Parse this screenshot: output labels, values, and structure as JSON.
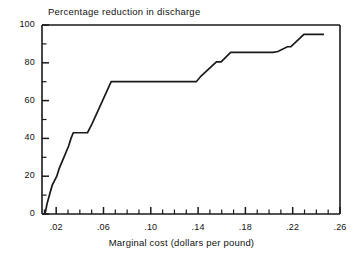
{
  "chart_data": {
    "type": "line",
    "title": "Percentage reduction in discharge",
    "subtitle": "",
    "xlabel": "Marginal cost (dollars per pound)",
    "ylabel": "Percentage reduction in discharge",
    "xlim": [
      0.008,
      0.26
    ],
    "ylim": [
      0,
      100
    ],
    "grid": false,
    "legend": "none",
    "xtick_labels": [
      ".02",
      ".06",
      ".10",
      ".14",
      ".18",
      ".22",
      ".26"
    ],
    "xtick_values": [
      0.02,
      0.06,
      0.1,
      0.14,
      0.18,
      0.22,
      0.26
    ],
    "xminor_step": 0.01,
    "ytick_labels": [
      "0",
      "20",
      "40",
      "60",
      "80",
      "100"
    ],
    "ytick_values": [
      0,
      20,
      40,
      60,
      80,
      100
    ],
    "yminor_step": 10,
    "series": [
      {
        "name": "Marginal abatement cost curve",
        "x": [
          0.0105,
          0.0125,
          0.0165,
          0.0205,
          0.0225,
          0.0265,
          0.0305,
          0.0325,
          0.0345,
          0.0425,
          0.0465,
          0.0505,
          0.0665,
          0.1385,
          0.1425,
          0.1555,
          0.1595,
          0.1675,
          0.2035,
          0.2075,
          0.2155,
          0.2185,
          0.2295,
          0.2335,
          0.2465
        ],
        "y": [
          0,
          6,
          15,
          20,
          24,
          30,
          36,
          40,
          43,
          43,
          43,
          48,
          70,
          70,
          73,
          80.5,
          80.5,
          85.5,
          85.5,
          86,
          88.5,
          88.5,
          95,
          95,
          95
        ]
      }
    ],
    "annotations": []
  },
  "colors": {
    "line": "#1a1a1a",
    "axis": "#1a1a1a",
    "background": "#ffffff",
    "text": "#111111"
  }
}
